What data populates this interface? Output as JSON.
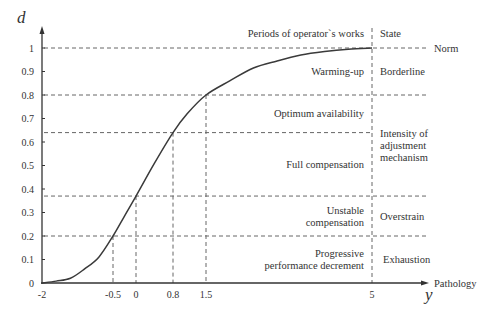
{
  "chart_data": {
    "type": "line",
    "title": "",
    "xlabel": "y",
    "ylabel": "d",
    "x_axis_end_label": "Pathology",
    "xlim": [
      -2,
      5
    ],
    "ylim": [
      0,
      1
    ],
    "x_ticks": [
      "-2",
      "-0.5",
      "0",
      "0.8",
      "1.5",
      "5"
    ],
    "y_ticks": [
      "0",
      "0.1",
      "0.2",
      "0.3",
      "0.4",
      "0.5",
      "0.6",
      "0.7",
      "0.8",
      "0.9",
      "1"
    ],
    "grid": false,
    "series": [
      {
        "name": "d(y)",
        "x": [
          -2,
          -1.7,
          -1.4,
          -1.1,
          -0.8,
          -0.5,
          -0.25,
          0,
          0.4,
          0.8,
          1.1,
          1.5,
          2.0,
          2.5,
          3.0,
          3.5,
          4.0,
          4.5,
          5
        ],
        "y": [
          0.0,
          0.008,
          0.02,
          0.06,
          0.11,
          0.2,
          0.285,
          0.37,
          0.51,
          0.64,
          0.72,
          0.8,
          0.86,
          0.915,
          0.945,
          0.97,
          0.985,
          0.995,
          1.0
        ]
      }
    ],
    "reference_lines": {
      "horizontal": [
        {
          "y": 1.0,
          "label": "Norm"
        },
        {
          "y": 0.8
        },
        {
          "y": 0.64
        },
        {
          "y": 0.37
        },
        {
          "y": 0.2
        }
      ],
      "vertical": [
        {
          "x": -0.5,
          "y_top": 0.2
        },
        {
          "x": 0,
          "y_top": 0.37
        },
        {
          "x": 0.8,
          "y_top": 0.64
        },
        {
          "x": 1.5,
          "y_top": 0.8
        },
        {
          "x": 5,
          "y_top": 1.0
        }
      ]
    },
    "column_headers": {
      "periods": "Periods of operator`s works",
      "state": "State"
    },
    "periods": [
      {
        "range": [
          0.8,
          1.0
        ],
        "lines": [
          "Warming-up"
        ]
      },
      {
        "range": [
          0.64,
          0.8
        ],
        "lines": [
          "Optimum availability"
        ]
      },
      {
        "range": [
          0.37,
          0.64
        ],
        "lines": [
          "Full compensation"
        ]
      },
      {
        "range": [
          0.2,
          0.37
        ],
        "lines": [
          "Unstable",
          "compensation"
        ]
      },
      {
        "range": [
          0.0,
          0.2
        ],
        "lines": [
          "Progressive",
          "performance decrement"
        ]
      }
    ],
    "states": [
      {
        "range": [
          0.8,
          1.0
        ],
        "lines": [
          "Borderline"
        ]
      },
      {
        "range": [
          0.37,
          0.8
        ],
        "lines": [
          "Intensity of",
          "adjustment",
          "mechanism"
        ]
      },
      {
        "range": [
          0.2,
          0.37
        ],
        "lines": [
          "Overstrain"
        ]
      },
      {
        "range": [
          0.0,
          0.2
        ],
        "lines": [
          "Exhaustion"
        ]
      }
    ]
  },
  "colors": {
    "axis": "#333333",
    "curve": "#3a3a3a",
    "dash": "#666666",
    "text": "#333333"
  }
}
